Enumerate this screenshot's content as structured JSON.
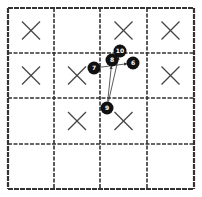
{
  "board": {
    "rows": 4,
    "cols": 4,
    "col_edges": [
      8,
      54,
      100,
      147,
      194
    ],
    "row_edges": [
      8,
      53,
      98,
      144,
      189
    ],
    "line_color": "#333333",
    "background": "#ffffff",
    "marks": [
      {
        "row": 0,
        "col": 0,
        "symbol": "X"
      },
      {
        "row": 0,
        "col": 2,
        "symbol": "X"
      },
      {
        "row": 0,
        "col": 3,
        "symbol": "X"
      },
      {
        "row": 1,
        "col": 0,
        "symbol": "X"
      },
      {
        "row": 1,
        "col": 1,
        "symbol": "X"
      },
      {
        "row": 1,
        "col": 3,
        "symbol": "X"
      },
      {
        "row": 2,
        "col": 1,
        "symbol": "X"
      },
      {
        "row": 2,
        "col": 2,
        "symbol": "X"
      }
    ]
  },
  "stones": [
    {
      "label": "10",
      "x": 120,
      "y": 51
    },
    {
      "label": "8",
      "x": 112,
      "y": 60
    },
    {
      "label": "6",
      "x": 133,
      "y": 63
    },
    {
      "label": "7",
      "x": 94,
      "y": 68
    },
    {
      "label": "9",
      "x": 107,
      "y": 108
    }
  ],
  "arrows": [
    {
      "from": "7",
      "to": "6"
    },
    {
      "from": "9",
      "to": "8"
    },
    {
      "from": "9",
      "to": "10"
    }
  ],
  "colors": {
    "stone": "#111111",
    "stone_text": "#ffffff",
    "mark": "#444444",
    "arrow": "#333333"
  }
}
